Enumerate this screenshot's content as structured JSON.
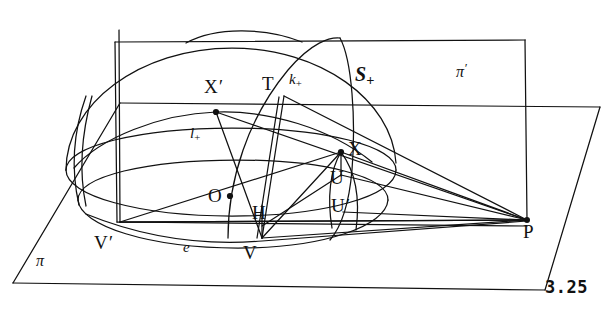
{
  "figure": {
    "number": "3.25",
    "domain": "geometric line diagram"
  },
  "labels": {
    "plane_pi": "π",
    "plane_pi_prime": "π",
    "plane_pi_prime_mark": "′",
    "sphere_S": "S",
    "sphere_S_sub": "+",
    "curve_k": "k",
    "curve_k_sub": "+",
    "curve_l": "l",
    "curve_l_sub": "+",
    "line_e": "e",
    "point_X_prime": "X",
    "point_X_prime_mark": "′",
    "point_T": "T",
    "point_X": "X",
    "point_O": "O",
    "point_H": "H",
    "point_U": "U",
    "point_U_prime": "U",
    "point_U_prime_mark": "′",
    "point_V": "V",
    "point_V_prime": "V",
    "point_V_prime_mark": "′",
    "point_P": "P"
  },
  "colors": {
    "ink": "#111111",
    "paper": "#ffffff"
  },
  "geometry": {
    "plane_pi_quad": "13,283 545,290 600,107 120,103",
    "plane_pi_prime_rect": "115,42 525,40 527,220 117,222",
    "sphere_center": [
      230,
      165
    ],
    "sphere_rx": 165,
    "sphere_ry": 118,
    "point_coords": {
      "X_prime": [
        216,
        112
      ],
      "T": [
        284,
        96
      ],
      "X": [
        341,
        152
      ],
      "O": [
        230,
        196
      ],
      "H": [
        258,
        226
      ],
      "U": [
        341,
        175
      ],
      "U_prime": [
        343,
        212
      ],
      "V": [
        258,
        238
      ],
      "V_prime": [
        120,
        222
      ],
      "P": [
        527,
        220
      ]
    }
  }
}
